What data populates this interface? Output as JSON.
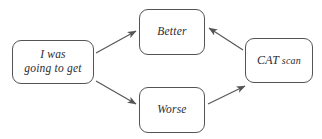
{
  "diagram": {
    "type": "flowchart",
    "background_color": "#ffffff",
    "stroke_color": "#545458",
    "text_color": "#2b2b30",
    "nodes": [
      {
        "id": "source",
        "name": "source-node",
        "label": "I was\ngoing to get",
        "shape": "rounded-rectangle",
        "x": 12,
        "y": 40,
        "width": 82,
        "height": 44
      },
      {
        "id": "better",
        "name": "better-node",
        "label": "Better",
        "shape": "rounded-rectangle",
        "x": 139,
        "y": 9,
        "width": 66,
        "height": 46
      },
      {
        "id": "worse",
        "name": "worse-node",
        "label": "Worse",
        "shape": "rounded-rectangle",
        "x": 139,
        "y": 87,
        "width": 66,
        "height": 46
      },
      {
        "id": "catscan",
        "name": "cat-scan-node",
        "label": "CAT scan",
        "label_lead": "CAT",
        "label_tail": " scan",
        "shape": "rounded-rectangle",
        "x": 245,
        "y": 38,
        "width": 68,
        "height": 45
      }
    ],
    "edges": [
      {
        "id": "source-to-better",
        "from": "source",
        "to": "better",
        "direction": "up-right",
        "x1": 96,
        "y1": 53,
        "x2": 136,
        "y2": 31
      },
      {
        "id": "source-to-worse",
        "from": "source",
        "to": "worse",
        "direction": "down-right",
        "x1": 96,
        "y1": 81,
        "x2": 136,
        "y2": 104
      },
      {
        "id": "catscan-to-better",
        "from": "catscan",
        "to": "better",
        "direction": "up-left",
        "x1": 243,
        "y1": 50,
        "x2": 209,
        "y2": 28
      },
      {
        "id": "worse-to-catscan",
        "from": "worse",
        "to": "catscan",
        "direction": "up-right",
        "x1": 208,
        "y1": 104,
        "x2": 245,
        "y2": 86
      }
    ]
  }
}
